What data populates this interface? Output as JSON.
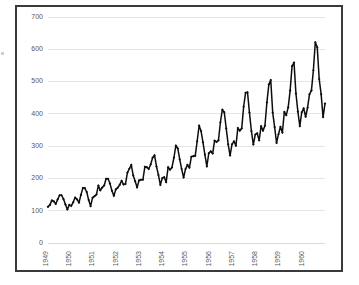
{
  "chart_data": {
    "type": "line",
    "title": "",
    "subtitle": "",
    "xlabel": "",
    "ylabel": "",
    "ylim": [
      0,
      700
    ],
    "yticks": [
      0,
      100,
      200,
      300,
      400,
      500,
      600,
      700
    ],
    "ytick_labels": [
      "0",
      "100",
      "200",
      "300",
      "400",
      "500",
      "600",
      "700"
    ],
    "xtick_labels": [
      "1949",
      "1950",
      "1951",
      "1952",
      "1953",
      "1954",
      "1955",
      "1956",
      "1957",
      "1958",
      "1959",
      "1960"
    ],
    "grid": true,
    "legend": false,
    "legend_position": "none",
    "marker": "diamond",
    "line_color": "#0d0d0d",
    "grid_color": "#e6e6e6",
    "frame_color": "#3a3a3a",
    "background_color": "#ffffff",
    "tick_label_color": "#595959",
    "xtick_rotation": -90,
    "x_count": 144,
    "series": [
      {
        "name": "International airline passengers (thousands)",
        "values": [
          112,
          118,
          132,
          129,
          121,
          135,
          148,
          148,
          136,
          119,
          104,
          118,
          115,
          126,
          141,
          135,
          125,
          149,
          170,
          170,
          158,
          133,
          114,
          140,
          145,
          150,
          178,
          163,
          172,
          178,
          199,
          199,
          184,
          162,
          146,
          166,
          171,
          180,
          193,
          181,
          183,
          218,
          230,
          242,
          209,
          191,
          172,
          194,
          196,
          196,
          236,
          235,
          229,
          243,
          264,
          272,
          237,
          211,
          180,
          201,
          204,
          188,
          235,
          227,
          234,
          264,
          302,
          293,
          259,
          229,
          203,
          229,
          242,
          233,
          267,
          269,
          270,
          315,
          364,
          347,
          312,
          274,
          237,
          278,
          284,
          277,
          317,
          313,
          318,
          374,
          413,
          405,
          355,
          306,
          271,
          306,
          315,
          301,
          356,
          348,
          355,
          422,
          465,
          467,
          404,
          347,
          305,
          336,
          340,
          318,
          362,
          348,
          363,
          435,
          491,
          505,
          404,
          359,
          310,
          337,
          360,
          342,
          406,
          396,
          420,
          472,
          548,
          559,
          463,
          407,
          362,
          405,
          417,
          391,
          419,
          461,
          472,
          535,
          622,
          606,
          508,
          461,
          390,
          432
        ]
      }
    ]
  }
}
